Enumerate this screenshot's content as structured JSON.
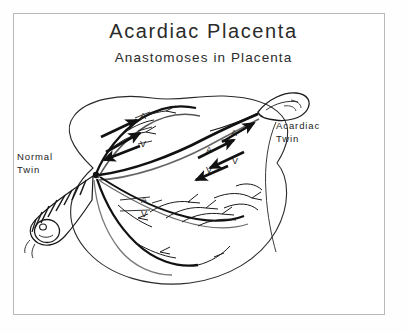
{
  "figure": {
    "title": "Acardiac Placenta",
    "subtitle": "Anastomoses in Placenta",
    "background_color": "#ffffff",
    "ink_color": "#1a1a1a",
    "frame_color": "#b8b8b8"
  },
  "labels": {
    "normal_twin": "Normal\nTwin",
    "normal_twin_line1": "Normal",
    "normal_twin_line2": "Twin",
    "acardiac_twin_line1": "Acardiac",
    "acardiac_twin_line2": "Twin"
  },
  "vessel_markers": [
    {
      "id": "a-left",
      "letter": "A",
      "x": 140,
      "y": 112
    },
    {
      "id": "v-left",
      "letter": "V",
      "x": 140,
      "y": 140
    },
    {
      "id": "a-mid-lower",
      "letter": "A",
      "x": 206,
      "y": 146
    },
    {
      "id": "a-mid-upper",
      "letter": "A",
      "x": 231,
      "y": 129
    },
    {
      "id": "v-mid-upper",
      "letter": "V",
      "x": 232,
      "y": 157
    },
    {
      "id": "v-mid-lower",
      "letter": "V",
      "x": 206,
      "y": 166
    },
    {
      "id": "a-lower",
      "letter": "A",
      "x": 141,
      "y": 196
    },
    {
      "id": "v-lower",
      "letter": "V",
      "x": 141,
      "y": 210
    }
  ]
}
